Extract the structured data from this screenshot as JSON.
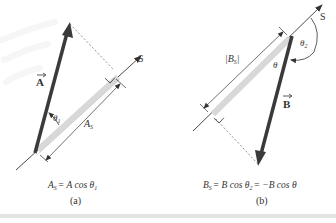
{
  "figure": {
    "panel_a": {
      "caption": "(a)",
      "equation": "A_S = A cos θ_1",
      "equation_parts": {
        "lhs": "A",
        "lhs_sub": "S",
        "rhs": "= A cos θ",
        "rhs_sub": "1"
      },
      "vector_label": "A",
      "axis_label": "S",
      "angle_label": "θ",
      "angle_sub": "1",
      "projection_label": "A",
      "projection_sub": "S"
    },
    "panel_b": {
      "caption": "(b)",
      "equation": "B_S = B cos θ_2 = −B cos θ",
      "equation_parts": {
        "lhs": "B",
        "lhs_sub": "S",
        "mid": "= B cos θ",
        "mid_sub": "2",
        "rhs": "= −B cos θ"
      },
      "vector_label": "B",
      "axis_label": "S",
      "angle_label": "θ",
      "angle2_label": "θ",
      "angle2_sub": "2",
      "projection_label": "|B",
      "projection_sub": "S",
      "projection_close": "|"
    },
    "colors": {
      "vector": "#3a3a3a",
      "projection_bar": "#d8d8d8",
      "axis": "#333333",
      "dashed": "#777777"
    }
  }
}
